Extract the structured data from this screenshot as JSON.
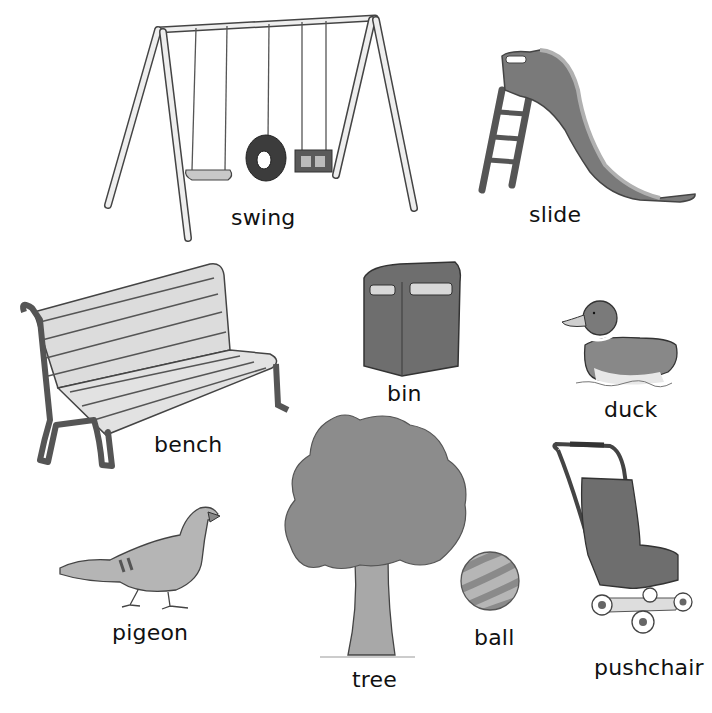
{
  "page": {
    "title": "",
    "background": "#ffffff"
  },
  "items": [
    {
      "id": "swing",
      "label": "swing"
    },
    {
      "id": "slide",
      "label": "slide"
    },
    {
      "id": "bench",
      "label": "bench"
    },
    {
      "id": "bin",
      "label": "bin"
    },
    {
      "id": "duck",
      "label": "duck"
    },
    {
      "id": "tree",
      "label": "tree"
    },
    {
      "id": "pigeon",
      "label": "pigeon"
    },
    {
      "id": "ball",
      "label": "ball"
    },
    {
      "id": "pushchair",
      "label": "pushchair"
    }
  ],
  "colors": {
    "ink": "#333333",
    "dark_fill": "#6e6e6e",
    "mid_fill": "#8f8f8f",
    "light_fill": "#c8c8c8",
    "pale_fill": "#e4e4e4"
  }
}
